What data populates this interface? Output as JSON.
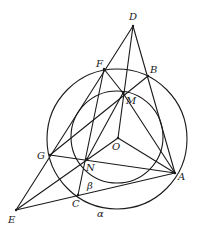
{
  "diagram": {
    "type": "geometry",
    "circles": [
      {
        "name": "outer-circle",
        "cx": 117,
        "cy": 139,
        "r": 70
      },
      {
        "name": "inner-circle",
        "cx": 117,
        "cy": 137,
        "r": 46
      }
    ],
    "points": {
      "D": {
        "x": 133,
        "y": 26,
        "label": "D",
        "lx": 129,
        "ly": 20
      },
      "F": {
        "x": 104,
        "y": 69,
        "label": "F",
        "lx": 96,
        "ly": 67
      },
      "B": {
        "x": 148,
        "y": 76,
        "label": "B",
        "lx": 150,
        "ly": 73
      },
      "M": {
        "x": 123,
        "y": 93,
        "label": "M",
        "lx": 126,
        "ly": 104
      },
      "O": {
        "x": 118,
        "y": 138,
        "label": "O",
        "lx": 112,
        "ly": 150
      },
      "G": {
        "x": 50,
        "y": 155,
        "label": "G",
        "lx": 37,
        "ly": 159
      },
      "N": {
        "x": 87,
        "y": 159,
        "label": "N",
        "lx": 86,
        "ly": 171
      },
      "A": {
        "x": 175,
        "y": 173,
        "label": "A",
        "lx": 178,
        "ly": 180
      },
      "C": {
        "x": 78,
        "y": 195,
        "label": "C",
        "lx": 72,
        "ly": 207
      },
      "E": {
        "x": 16,
        "y": 210,
        "label": "E",
        "lx": 8,
        "ly": 223
      }
    },
    "segments": [
      [
        "D",
        "E"
      ],
      [
        "D",
        "A"
      ],
      [
        "D",
        "O"
      ],
      [
        "F",
        "M"
      ],
      [
        "M",
        "A"
      ],
      [
        "F",
        "C"
      ],
      [
        "G",
        "B"
      ],
      [
        "G",
        "A"
      ],
      [
        "E",
        "A"
      ],
      [
        "E",
        "O"
      ],
      [
        "N",
        "M"
      ],
      [
        "O",
        "A"
      ]
    ],
    "angle_labels": [
      {
        "name": "alpha",
        "text": "α",
        "x": 97,
        "y": 217
      },
      {
        "name": "beta",
        "text": "β",
        "x": 87,
        "y": 189
      }
    ]
  }
}
